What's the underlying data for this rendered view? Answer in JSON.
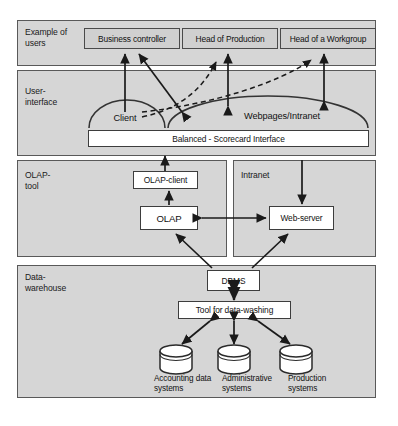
{
  "diagram": {
    "colors": {
      "panel_fill": "#d6d6d6",
      "panel_border": "#595959",
      "userbox_fill": "#d0d0d0",
      "box_fill": "#ffffff",
      "box_border": "#3d3d3d",
      "arrow": "#1a1a1a",
      "page_background": "#ffffff"
    },
    "layers": [
      {
        "id": "users",
        "label": "Example of\nusers"
      },
      {
        "id": "user-interface",
        "label": "User-\ninterface"
      },
      {
        "id": "olap-tool",
        "label": "OLAP-\ntool"
      },
      {
        "id": "data-warehouse",
        "label": "Data-\nwarehouse"
      }
    ],
    "users": {
      "boxes": [
        {
          "id": "business-controller",
          "label": "Business controller"
        },
        {
          "id": "head-of-production",
          "label": "Head of Production"
        },
        {
          "id": "head-of-a-workgroup",
          "label": "Head of a Workgroup"
        }
      ]
    },
    "user_interface": {
      "domes": [
        {
          "id": "client",
          "label": "Client"
        },
        {
          "id": "webpages-intranet",
          "label": "Webpages/Intranet"
        }
      ],
      "interface_bar": {
        "id": "balanced-scorecard-interface",
        "label": "Balanced - Scorecard Interface"
      }
    },
    "olap_tool": {
      "subpanel_label": "Intranet",
      "boxes": [
        {
          "id": "olap-client",
          "label": "OLAP-client"
        },
        {
          "id": "olap",
          "label": "OLAP"
        },
        {
          "id": "web-server",
          "label": "Web-server"
        }
      ]
    },
    "data_warehouse": {
      "boxes": [
        {
          "id": "dbms",
          "label": "DBMS"
        },
        {
          "id": "tool-for-data-washing",
          "label": "Tool for data-washing"
        }
      ],
      "sources": [
        {
          "id": "accounting-data-systems",
          "label": "Accounting data\nsystems"
        },
        {
          "id": "administrative-systems",
          "label": "Administrative\nsystems"
        },
        {
          "id": "production-systems",
          "label": "Production\nsystems"
        }
      ]
    }
  }
}
